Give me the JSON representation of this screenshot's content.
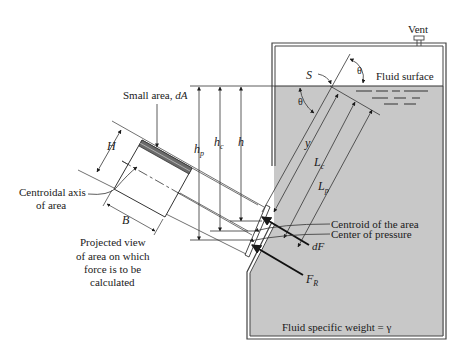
{
  "diagram": {
    "colors": {
      "fluid": "#c8c8c8",
      "line": "#1a1a1a",
      "wall": "#444444",
      "background": "#ffffff",
      "plate_hatch": "#6a6a6a"
    },
    "labels": {
      "vent": "Vent",
      "fluid_surface": "Fluid surface",
      "s_label": "S",
      "theta_top": "θ",
      "theta_left": "θ",
      "small_area": "Small area, dA",
      "small_area_text": "Small area, ",
      "small_area_symbol": "dA",
      "h_p": "h",
      "h_p_sub": "p",
      "h_c": "h",
      "h_c_sub": "c",
      "h": "h",
      "y": "y",
      "L_c": "L",
      "L_c_sub": "c",
      "L_p": "L",
      "L_p_sub": "p",
      "H": "H",
      "B": "B",
      "centroidal_axis_line1": "Centroidal axis",
      "centroidal_axis_line2": "of area",
      "projected_view_line1": "Projected view",
      "projected_view_line2": "of area on which",
      "projected_view_line3": "force is to be",
      "projected_view_line4": "calculated",
      "centroid_of_area": "Centroid of the area",
      "center_of_pressure": "Center of pressure",
      "dF": "dF",
      "F_R": "F",
      "F_R_sub": "R",
      "fluid_specific_weight": "Fluid specific weight = γ"
    }
  }
}
